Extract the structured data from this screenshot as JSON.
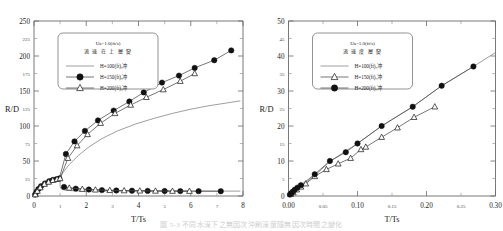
{
  "figure": {
    "bottom_caption": "圖 5-3  不同水深下之無因次沖刷深度隨無因次時間之變化"
  },
  "chart_data": [
    {
      "id": "left",
      "type": "scatter",
      "title": "",
      "xlabel": "T/Ts",
      "ylabel": "R/D",
      "xlim": [
        0,
        8
      ],
      "ylim": [
        0,
        250
      ],
      "xticks": [
        0,
        1,
        2,
        3,
        4,
        5,
        6,
        7,
        8
      ],
      "xticklabels": [
        "0",
        "1",
        "2",
        "3",
        "4",
        "5",
        "6",
        "7",
        "8"
      ],
      "yticks": [
        0,
        25,
        50,
        75,
        100,
        125,
        150,
        175,
        200,
        225,
        250
      ],
      "yticklabels": [
        "0",
        "25",
        "50",
        "75",
        "100",
        "125",
        "150",
        "175",
        "200",
        "225",
        "250"
      ],
      "grid": false,
      "legend_position": "upper-left",
      "legend": {
        "header": "Ua=1.0(ft/s)",
        "subheader": "流 速 在 上 層 變",
        "entries": [
          {
            "label": "H=100(ft),冲",
            "marker": "line"
          },
          {
            "label": "H=150(ft),冲",
            "marker": "circle"
          },
          {
            "label": "H=200(ft),冲",
            "marker": "triangle"
          }
        ]
      },
      "series": [
        {
          "name": "H=100(ft)",
          "marker": "line",
          "x": [
            0,
            0.05,
            0.12,
            0.22,
            0.35,
            0.5,
            0.7,
            0.85,
            0.93,
            0.97,
            1.0,
            1.0,
            1.02,
            1.1,
            1.25,
            1.5,
            1.8,
            2.2,
            2.7,
            3.3,
            4.0,
            4.8,
            5.6,
            6.4,
            7.2,
            7.9
          ],
          "y": [
            0,
            3,
            7,
            11,
            15,
            19,
            22,
            24,
            25,
            25,
            25,
            14,
            11,
            9,
            8,
            7.5,
            7.2,
            7.0,
            7.0,
            7.0,
            7.0,
            7.0,
            7.0,
            7.0,
            7.0,
            7.0
          ]
        },
        {
          "name": "H=100(ft) upper",
          "marker": "line",
          "x": [
            0.95,
            1.1,
            1.35,
            1.7,
            2.1,
            2.6,
            3.2,
            3.9,
            4.6,
            5.3,
            6.0,
            6.7,
            7.4,
            7.9
          ],
          "y": [
            24,
            33,
            45,
            58,
            70,
            82,
            93,
            103,
            111,
            118,
            124,
            129,
            133,
            136
          ]
        },
        {
          "name": "H=150(ft)",
          "marker": "circle",
          "x": [
            0.04,
            0.1,
            0.17,
            0.27,
            0.42,
            0.58,
            0.72,
            0.86,
            0.97,
            1.22,
            1.55,
            1.95,
            2.45,
            3.05,
            3.65,
            4.2,
            4.9,
            5.55,
            6.15,
            6.9,
            7.55
          ],
          "y": [
            2,
            6,
            10,
            14,
            18,
            21,
            23,
            24,
            25,
            60,
            78,
            93,
            108,
            122,
            135,
            148,
            162,
            172,
            183,
            194,
            208
          ]
        },
        {
          "name": "H=150(ft) decay",
          "marker": "circle",
          "x": [
            1.15,
            1.6,
            2.1,
            2.6,
            3.15,
            3.75,
            4.35,
            5.0,
            5.6,
            6.3,
            7.15
          ],
          "y": [
            13,
            10.5,
            9.2,
            8.4,
            7.9,
            7.6,
            7.3,
            7.1,
            7.0,
            6.9,
            6.8
          ]
        },
        {
          "name": "H=200(ft)",
          "marker": "triangle",
          "x": [
            0.05,
            0.13,
            0.24,
            0.4,
            0.56,
            0.72,
            0.88,
            1.0,
            1.3,
            1.65,
            2.05,
            2.55,
            3.1,
            3.7,
            4.3,
            4.95,
            5.6,
            6.15
          ],
          "y": [
            2,
            7,
            12,
            17,
            20,
            22.5,
            24,
            25,
            54,
            72,
            88,
            104,
            118,
            130,
            141,
            152,
            164,
            175
          ]
        },
        {
          "name": "H=200(ft) decay",
          "marker": "triangle",
          "x": [
            1.35,
            1.85,
            2.35,
            2.9,
            3.45,
            4.05,
            4.65,
            5.3,
            5.95
          ],
          "y": [
            11.5,
            9.8,
            8.8,
            8.1,
            7.7,
            7.4,
            7.2,
            7.0,
            6.9
          ]
        }
      ]
    },
    {
      "id": "right",
      "type": "scatter",
      "title": "",
      "xlabel": "T/Ts",
      "ylabel": "R/D",
      "xlim": [
        0,
        0.3
      ],
      "ylim": [
        0,
        50
      ],
      "xticks": [
        0,
        0.05,
        0.1,
        0.15,
        0.2,
        0.25,
        0.3
      ],
      "xticklabels": [
        "0.00",
        "0.05",
        "0.10",
        "0.15",
        "0.20",
        "0.25",
        "0.30"
      ],
      "yticks": [
        0,
        5,
        10,
        15,
        20,
        25,
        30,
        35,
        40,
        45,
        50
      ],
      "yticklabels": [
        "0",
        "5",
        "10",
        "15",
        "20",
        "25",
        "30",
        "35",
        "40",
        "45",
        "50"
      ],
      "grid": false,
      "legend_position": "upper-left",
      "legend": {
        "header": "Ua=1.0(ft/s)",
        "subheader": "流 速 度 層 變",
        "entries": [
          {
            "label": "H=100(ft),冲",
            "marker": "line"
          },
          {
            "label": "H=150(ft),冲",
            "marker": "triangle"
          },
          {
            "label": "H=200(ft),冲",
            "marker": "circle"
          }
        ]
      },
      "series": [
        {
          "name": "H=100(ft)",
          "marker": "line",
          "x": [
            0,
            0.01,
            0.02,
            0.04,
            0.06,
            0.08,
            0.1,
            0.135,
            0.18,
            0.222,
            0.268,
            0.3
          ],
          "y": [
            0,
            1.6,
            3.0,
            6.2,
            9.8,
            12.5,
            15.0,
            20.0,
            25.5,
            31.5,
            37.0,
            41.0
          ]
        },
        {
          "name": "H=150(ft)",
          "marker": "triangle",
          "x": [
            0.003,
            0.007,
            0.012,
            0.018,
            0.025,
            0.038,
            0.055,
            0.072,
            0.09,
            0.105,
            0.112,
            0.135,
            0.158,
            0.182,
            0.212
          ],
          "y": [
            0.5,
            1.0,
            1.8,
            2.6,
            3.5,
            5.6,
            7.6,
            9.2,
            10.8,
            13.3,
            14.0,
            16.8,
            19.5,
            22.5,
            25.5
          ]
        },
        {
          "name": "H=200(ft)",
          "marker": "circle",
          "x": [
            0.002,
            0.004,
            0.006,
            0.009,
            0.013,
            0.018,
            0.038,
            0.06,
            0.083,
            0.1,
            0.135,
            0.18,
            0.222,
            0.268
          ],
          "y": [
            0.4,
            0.8,
            1.2,
            1.8,
            2.4,
            3.1,
            6.2,
            10.0,
            12.5,
            15.0,
            20.0,
            25.5,
            31.5,
            37.0
          ]
        }
      ]
    }
  ]
}
